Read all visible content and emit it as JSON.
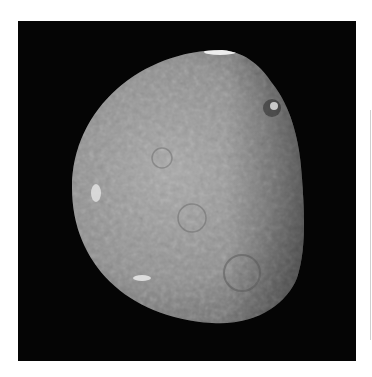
{
  "image": {
    "subject": "moon-crescent-gibbous",
    "description": "Gray cratered moon, lit from the left, terminator on the right, against black space",
    "colors": {
      "page_background": "#ffffff",
      "space_background": "#050505",
      "surface_light": "#b8b8b8",
      "surface_mid": "#8a8a8a",
      "surface_dark": "#3a3a3a",
      "highlight": "#f2f2f2"
    }
  }
}
